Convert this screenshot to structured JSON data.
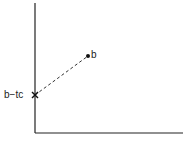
{
  "diagram": {
    "labels": {
      "point_b": "b",
      "intercept": "b−tc"
    },
    "colors": {
      "line": "#222222",
      "background": "#ffffff"
    }
  }
}
